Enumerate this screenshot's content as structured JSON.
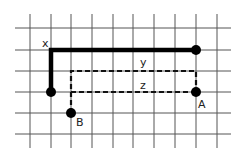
{
  "diagram": {
    "type": "grid-path-diagram",
    "grid": {
      "h_lines_y": [
        28,
        50,
        71,
        92,
        113,
        134
      ],
      "v_lines_x": [
        30,
        51,
        71,
        92,
        113,
        133,
        154,
        175,
        196,
        217
      ],
      "x_range": [
        15,
        231
      ],
      "y_range": [
        14,
        148
      ],
      "color": "#555555"
    },
    "paths": [
      {
        "name": "path-x",
        "style": "solid-thick",
        "points": "51,92 51,50 196,50"
      },
      {
        "name": "path-y",
        "style": "dashed",
        "points": "71,113 71,71 196,71 196,92"
      },
      {
        "name": "path-z",
        "style": "dashed",
        "points": "71,92 196,92"
      }
    ],
    "points": [
      {
        "name": "start-point",
        "cx": 51,
        "cy": 92
      },
      {
        "name": "end-point-x",
        "cx": 196,
        "cy": 50
      },
      {
        "name": "point-a",
        "cx": 196,
        "cy": 92
      },
      {
        "name": "point-b",
        "cx": 71,
        "cy": 113
      }
    ],
    "labels": {
      "x": "x",
      "y": "y",
      "z": "z",
      "a": "A",
      "b": "B"
    }
  }
}
